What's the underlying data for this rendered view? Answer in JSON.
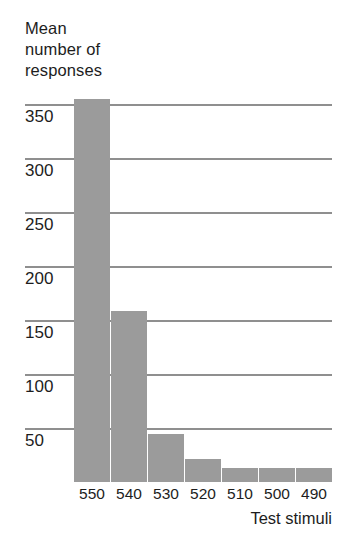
{
  "chart_data": {
    "type": "bar",
    "title": "",
    "ylabel": "Mean number of responses",
    "ylabel_lines": [
      "Mean",
      "number of",
      "responses"
    ],
    "xlabel": "Test stimuli",
    "categories": [
      "550",
      "540",
      "530",
      "520",
      "510",
      "500",
      "490"
    ],
    "values": [
      355,
      158,
      44,
      21,
      13,
      13,
      13
    ],
    "ylim": [
      0,
      382
    ],
    "yticks": [
      350,
      300,
      250,
      200,
      150,
      100,
      50
    ],
    "ytick_labels": [
      "350",
      "300",
      "250",
      "200",
      "150",
      "100",
      "50"
    ],
    "grid": true,
    "grid_axis": "y",
    "legend": "none",
    "series": [
      {
        "name": "Mean number of responses",
        "values": [
          355,
          158,
          44,
          21,
          13,
          13,
          13
        ]
      }
    ],
    "colors": {
      "bar": "#9b9b9b",
      "gridline": "#8f8f8f",
      "text": "#1d1d1d",
      "background": "#ffffff"
    }
  }
}
